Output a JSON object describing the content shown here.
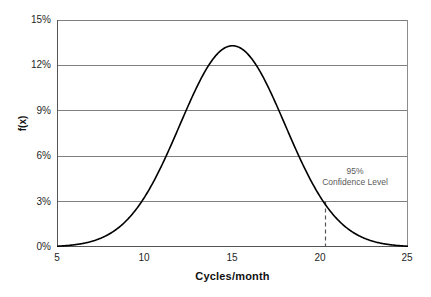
{
  "chart_data": {
    "type": "line",
    "title": "",
    "subtitle": "",
    "xlabel": "Cycles/month",
    "ylabel": "f(x)",
    "xlim": [
      5,
      25
    ],
    "ylim": [
      0,
      0.15
    ],
    "grid": true,
    "legend": null,
    "x_ticks": [
      {
        "value": 5,
        "label": "5"
      },
      {
        "value": 10,
        "label": "10"
      },
      {
        "value": 15,
        "label": "15"
      },
      {
        "value": 20,
        "label": "20"
      },
      {
        "value": 25,
        "label": "25"
      }
    ],
    "y_ticks": [
      {
        "value": 0.15,
        "label": "15%"
      },
      {
        "value": 0.12,
        "label": "12%"
      },
      {
        "value": 0.09,
        "label": "9%"
      },
      {
        "value": 0.06,
        "label": "6%"
      },
      {
        "value": 0.03,
        "label": "3%"
      },
      {
        "value": 0.0,
        "label": "0%"
      }
    ],
    "series": [
      {
        "name": "normal-pdf",
        "distribution": "normal",
        "mean": 15,
        "sigma": 3,
        "peak_x": 15,
        "peak_y": 0.133,
        "color": "#000000",
        "x": [
          5,
          6,
          7,
          8,
          9,
          10,
          11,
          12,
          13,
          14,
          15,
          16,
          17,
          18,
          19,
          20,
          21,
          22,
          23,
          24,
          25
        ],
        "values": [
          0.0018,
          0.0036,
          0.0066,
          0.011,
          0.018,
          0.027,
          0.038,
          0.05,
          0.063,
          0.073,
          0.078,
          0.073,
          0.063,
          0.05,
          0.038,
          0.027,
          0.018,
          0.011,
          0.0066,
          0.0036,
          0.0018
        ]
      }
    ],
    "annotations": [
      {
        "name": "confidence-level",
        "lines": [
          "95%",
          "Confidence Level"
        ],
        "text_x": 21.8,
        "text_y": 0.052,
        "color": "#5a5a5a"
      }
    ],
    "markers": [
      {
        "name": "confidence-threshold",
        "type": "vertical-dashed-line",
        "x": 20.3,
        "y_from": 0.0,
        "y_to": 0.03,
        "color": "#555555"
      }
    ],
    "colors": {
      "curve": "#000000",
      "gridline": "#7f7f7f",
      "axis": "#555555",
      "plot_border": "#8c8c8c",
      "background": "#ffffff",
      "tick_label": "#1f1f1f",
      "annotation": "#5a5a5a"
    }
  },
  "axes": {
    "x_title": "Cycles/month",
    "y_title": "f(x)"
  },
  "x_labels": [
    "5",
    "10",
    "15",
    "20",
    "25"
  ],
  "y_labels": [
    "15%",
    "12%",
    "9%",
    "6%",
    "3%",
    "0%"
  ],
  "annotation": {
    "line1": "95%",
    "line2": "Confidence Level"
  }
}
